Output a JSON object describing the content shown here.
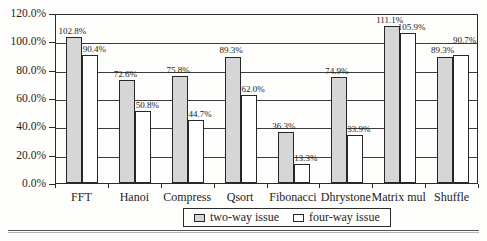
{
  "chart_data": {
    "type": "bar",
    "title": "",
    "xlabel": "",
    "ylabel": "",
    "categories": [
      "FFT",
      "Hanoi",
      "Compress",
      "Qsort",
      "Fibonacci",
      "Dhrystone",
      "Matrix mul",
      "Shuffle"
    ],
    "series": [
      {
        "name": "two-way issue",
        "fill": "#d6d6d6",
        "values": [
          102.8,
          72.6,
          75.8,
          89.3,
          36.3,
          74.9,
          111.1,
          89.3
        ]
      },
      {
        "name": "four-way issue",
        "fill": "#ffffff",
        "values": [
          90.4,
          50.8,
          44.7,
          62.0,
          13.3,
          33.9,
          105.9,
          90.7
        ]
      }
    ],
    "value_labels": [
      [
        "102.8%",
        "72.6%",
        "75.8%",
        "89.3%",
        "36.3%",
        "74.9%",
        "111.1%",
        "89.3%"
      ],
      [
        "90.4%",
        "50.8%",
        "44.7%",
        "62.0%",
        "13.3%",
        "33.9%",
        "105.9%",
        "90.7%"
      ]
    ],
    "ylim": [
      0,
      120
    ],
    "ytick_step": 20,
    "ytick_labels": [
      "0.0%",
      "20.0%",
      "40.0%",
      "60.0%",
      "80.0%",
      "100.0%",
      "120.0%"
    ],
    "grid": true,
    "legend_position": "bottom",
    "legend_entries": [
      "two-way issue",
      "four-way issue"
    ]
  },
  "colors": {
    "bar_two_way": "#d6d6d6",
    "bar_four_way": "#ffffff",
    "axis_line": "#2b2b2b",
    "text": "#1d1d1d",
    "background": "#fdfdfb"
  }
}
